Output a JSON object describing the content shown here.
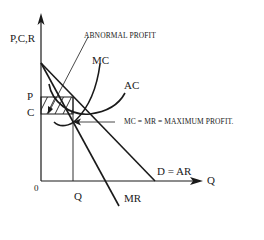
{
  "diagram": {
    "type": "economics-monopoly-equilibrium",
    "axes": {
      "y_label": "P,C,R",
      "x_label": "Q",
      "origin_label": "0"
    },
    "levels": {
      "price_label": "P",
      "cost_label": "C",
      "quantity_label": "Q"
    },
    "curves": {
      "mc_label": "MC",
      "ac_label": "AC",
      "demand_label": "D = AR",
      "mr_label": "MR"
    },
    "annotations": {
      "abnormal_profit": "ABNORMAL PROFIT",
      "equilibrium": "MC = MR = MAXIMUM PROFIT."
    },
    "colors": {
      "line": "#1a1a1a",
      "background": "#ffffff"
    }
  }
}
